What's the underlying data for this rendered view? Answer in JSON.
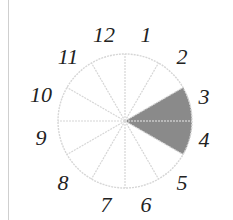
{
  "diagram": {
    "type": "circle-divided-into-sectors",
    "total_sectors": 12,
    "shaded_sectors": [
      3,
      4
    ],
    "shade_color": "#8a8a8a",
    "line_color": "#d6d6d6",
    "labels": [
      "1",
      "2",
      "3",
      "4",
      "5",
      "6",
      "7",
      "8",
      "9",
      "10",
      "11",
      "12"
    ]
  }
}
